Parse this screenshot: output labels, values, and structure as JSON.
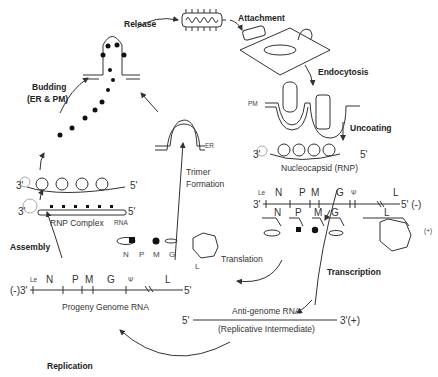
{
  "steps": {
    "release": "Release",
    "attachment": "Attachment",
    "endocytosis": "Endocytosis",
    "uncoating": "Uncoating",
    "transcription": "Transcription",
    "translation": "Translation",
    "replication": "Replication",
    "assembly": "Assembly",
    "budding_line1": "Budding",
    "budding_line2": "(ER & PM)",
    "trimer_line1": "Trimer",
    "trimer_line2": "Formation"
  },
  "labels": {
    "pm": "PM",
    "er": "ER",
    "nucleocapsid": "Nucleocapsid (RNP)",
    "rnp_complex": "RNP Complex",
    "rna": "RNA",
    "progeny_genome": "Progeny Genome RNA",
    "antigenome": "Anti-genome RNA",
    "replicative_intermediate": "(Replicative Intermediate)"
  },
  "genome_negative": {
    "left_end": "3'",
    "right_end": "5' (-)",
    "genes": [
      "Le",
      "N",
      "P",
      "M",
      "G",
      "Ψ",
      "L"
    ]
  },
  "mrnas": {
    "genes": [
      "N",
      "P",
      "M",
      "G",
      "L"
    ],
    "polarity": "(+)",
    "five_prime": "5'",
    "three_prime": "3'"
  },
  "proteins": {
    "items": [
      "N",
      "P",
      "M",
      "G",
      "L"
    ]
  },
  "progeny_genome": {
    "left_end": "(-)3'",
    "right_end": "5'",
    "genes": [
      "Le",
      "N",
      "P",
      "M",
      "G",
      "Ψ",
      "L"
    ]
  },
  "antigenome": {
    "left_end": "5'",
    "right_end": "3'(+)"
  },
  "rnp_ends": {
    "three": "3'",
    "five": "5'"
  }
}
